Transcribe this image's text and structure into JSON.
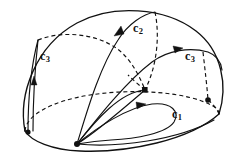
{
  "figure": {
    "background_color": "#ffffff",
    "line_color": "#111111",
    "width": 239,
    "height": 156
  },
  "labels": [
    {
      "id": "c3-left",
      "base": "c",
      "sub": "3",
      "x": 40,
      "y": 56
    },
    {
      "id": "c2-top",
      "base": "c",
      "sub": "2",
      "x": 133,
      "y": 28
    },
    {
      "id": "c3-right",
      "base": "c",
      "sub": "3",
      "x": 185,
      "y": 55
    },
    {
      "id": "c1-front",
      "base": "c",
      "sub": "1",
      "x": 172,
      "y": 113
    }
  ],
  "vertices": [
    {
      "id": "basepoint",
      "x": 77,
      "y": 144,
      "r": 3.0
    },
    {
      "id": "left-foot",
      "x": 28,
      "y": 132,
      "r": 2.6
    },
    {
      "id": "equator-mid",
      "x": 145,
      "y": 90,
      "r": 2.8
    },
    {
      "id": "equator-right",
      "x": 208,
      "y": 100,
      "r": 2.8
    }
  ],
  "curves": [
    {
      "id": "dome-outline",
      "style": "solid",
      "hidden": false
    },
    {
      "id": "equator-front-arc",
      "style": "solid",
      "hidden": false
    },
    {
      "id": "equator-back-arc",
      "style": "dashed",
      "hidden": true
    },
    {
      "id": "c3-left-meridian",
      "style": "solid",
      "hidden": false
    },
    {
      "id": "c3-left-dashed-arc",
      "style": "dashed",
      "hidden": true
    },
    {
      "id": "c2-meridian",
      "style": "solid",
      "hidden": false
    },
    {
      "id": "c2-dashed-descent",
      "style": "dashed",
      "hidden": true
    },
    {
      "id": "c3-right-band",
      "style": "solid",
      "hidden": false
    },
    {
      "id": "c3-right-dashed-leg",
      "style": "dashed",
      "hidden": true
    },
    {
      "id": "basepoint-to-mid",
      "style": "solid",
      "hidden": false
    },
    {
      "id": "c1-loop",
      "style": "solid",
      "hidden": false
    },
    {
      "id": "basepoint-skirt",
      "style": "solid",
      "hidden": false
    }
  ],
  "arrows": [
    {
      "id": "arrow-c3-left",
      "x": 34,
      "y": 82,
      "angle": -82
    },
    {
      "id": "arrow-c2",
      "x": 119,
      "y": 31,
      "angle": -58
    },
    {
      "id": "arrow-c3-right",
      "x": 176,
      "y": 49,
      "angle": 10
    },
    {
      "id": "arrow-c1",
      "x": 139,
      "y": 106,
      "angle": 5
    }
  ]
}
